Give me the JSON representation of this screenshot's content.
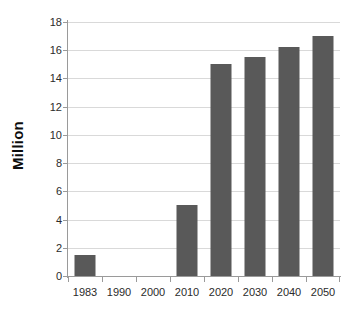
{
  "chart_data": {
    "type": "bar",
    "title": "",
    "xlabel": "",
    "ylabel": "Million",
    "categories": [
      "1983",
      "1990",
      "2000",
      "2010",
      "2020",
      "2030",
      "2040",
      "2050"
    ],
    "values": [
      1.5,
      0,
      0,
      5.0,
      15.0,
      15.5,
      16.25,
      17.0
    ],
    "ylim": [
      0,
      18
    ],
    "ytick_labels": [
      "0",
      "2",
      "4",
      "6",
      "8",
      "10",
      "12",
      "14",
      "16",
      "18"
    ],
    "ytick_values": [
      0,
      2,
      4,
      6,
      8,
      10,
      12,
      14,
      16,
      18
    ],
    "grid": "horizontal",
    "legend": "none",
    "bar_color": "#595959",
    "gridline_color": "#d9d9d9",
    "axis_color": "#9a9a9a",
    "background_color": "#ffffff"
  }
}
